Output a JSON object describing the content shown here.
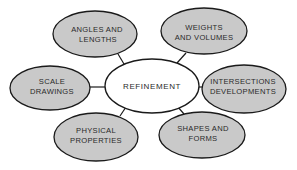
{
  "diagram": {
    "colors": {
      "background": "#ffffff",
      "outer_fill": "#c9c9c9",
      "center_fill": "#ffffff",
      "stroke": "#1a1a1a",
      "text": "#2a2a2a"
    },
    "center": {
      "label": "REFINEMENT"
    },
    "nodes": [
      {
        "id": "angles-and-lengths",
        "line1": "ANGLES AND",
        "line2": "LENGTHS"
      },
      {
        "id": "weights-and-volumes",
        "line1": "WEIGHTS",
        "line2": "AND VOLUMES"
      },
      {
        "id": "scale-drawings",
        "line1": "SCALE",
        "line2": "DRAWINGS"
      },
      {
        "id": "intersections-developments",
        "line1": "INTERSECTIONS",
        "line2": "DEVELOPMENTS"
      },
      {
        "id": "physical-properties",
        "line1": "PHYSICAL",
        "line2": "PROPERTIES"
      },
      {
        "id": "shapes-and-forms",
        "line1": "SHAPES AND",
        "line2": "FORMS"
      }
    ]
  }
}
